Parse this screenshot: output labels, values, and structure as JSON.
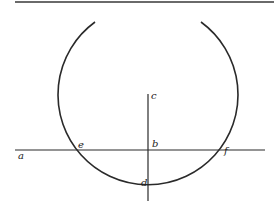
{
  "diagram": {
    "title": "",
    "labels": {
      "a": "a",
      "b": "b",
      "c": "c",
      "d": "d",
      "e": "e",
      "f": "f"
    },
    "colors": {
      "stroke": "#2a2a2a",
      "top_rule": "#6a6a6a",
      "background": "#ffffff"
    }
  }
}
